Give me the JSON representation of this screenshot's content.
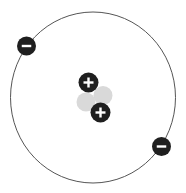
{
  "diagram": {
    "type": "atom-model",
    "orbit": {
      "cx": 93,
      "cy": 97.5,
      "rx": 82.5,
      "ry": 85.5,
      "stroke": "#555555"
    },
    "nucleus": {
      "protons": [
        {
          "cx": 88.5,
          "cy": 82.5,
          "r": 10,
          "symbol": "+"
        },
        {
          "cx": 100.5,
          "cy": 112.5,
          "r": 10,
          "symbol": "+"
        }
      ],
      "neutrons": [
        {
          "cx": 103,
          "cy": 95.5,
          "r": 9.5
        },
        {
          "cx": 86,
          "cy": 102,
          "r": 9.5
        }
      ]
    },
    "electrons": [
      {
        "cx": 26.5,
        "cy": 46,
        "r": 9.5,
        "symbol": "-"
      },
      {
        "cx": 161.5,
        "cy": 146.5,
        "r": 9.5,
        "symbol": "-"
      }
    ],
    "colors": {
      "particle": "#1f1f1f",
      "neutron": "#d9d9d9",
      "symbol": "#ffffff"
    }
  }
}
